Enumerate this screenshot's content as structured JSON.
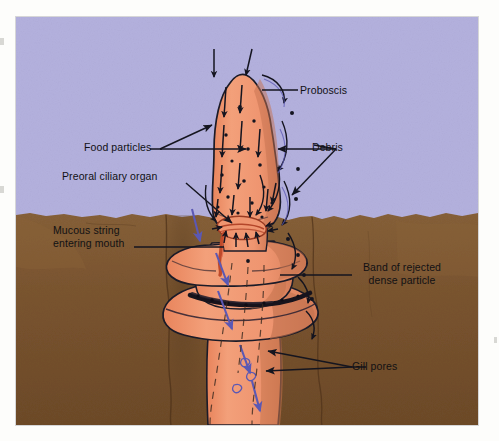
{
  "figure": {
    "media": {
      "water_label": "water column",
      "water_color": "#b4b1de",
      "sediment_label": "sediment",
      "sediment_color": "#7b5530",
      "sediment_dark_color": "#5d3f22",
      "sediment_light_color": "#8d6539",
      "body_color": "#f0976f",
      "body_shadow_color": "#c6714f",
      "outline_color": "#1b1b28",
      "mucous_color": "#c04a2a",
      "arrow_dark_color": "#14141f",
      "arrow_blue_color": "#5b58b4",
      "background_color": "#fdfdfb"
    },
    "labels": [
      {
        "id": "proboscis",
        "name": "Proboscis",
        "text": "Proboscis",
        "x": 300,
        "y": 90,
        "align": "left"
      },
      {
        "id": "food-particles",
        "name": "Food particles",
        "text": "Food particles",
        "x": 84,
        "y": 147,
        "align": "left"
      },
      {
        "id": "debris",
        "name": "Debris",
        "text": "Debris",
        "x": 312,
        "y": 147,
        "align": "left"
      },
      {
        "id": "preoral-ciliary-organ",
        "name": "Preoral ciliary organ",
        "text": "Preoral ciliary organ",
        "x": 62,
        "y": 175,
        "align": "left"
      },
      {
        "id": "mucous-string",
        "name": "Mucous string entering mouth",
        "line1": "Mucous string",
        "line2": "entering mouth",
        "x": 53,
        "y": 228,
        "align": "left"
      },
      {
        "id": "band-of-rejected",
        "name": "Band of rejected dense particle",
        "line1": "Band of rejected",
        "line2": "dense particle",
        "x": 352,
        "y": 265,
        "align": "center"
      },
      {
        "id": "gill-pores",
        "name": "Gill pores",
        "text": "Gill pores",
        "x": 352,
        "y": 365,
        "align": "left"
      }
    ],
    "anatomy": [
      {
        "id": "proboscis",
        "label": "Proboscis"
      },
      {
        "id": "collar",
        "label": "Collar"
      },
      {
        "id": "trunk",
        "label": "Trunk"
      },
      {
        "id": "preoral-ciliary-organ",
        "label": "Preoral ciliary organ"
      },
      {
        "id": "mouth",
        "label": "Mouth"
      },
      {
        "id": "gill-pores",
        "label": "Gill pores"
      }
    ],
    "flows": [
      {
        "id": "food-particle-flow",
        "label": "Food particles",
        "color": "#14141f",
        "note": "dark arrows running down the proboscis toward the mouth"
      },
      {
        "id": "debris-flow",
        "label": "Debris",
        "color": "#14141f",
        "note": "dark arrows sweeping down the outside of the proboscis"
      },
      {
        "id": "water-flow",
        "label": "Water current through gill pores",
        "color": "#5b58b4",
        "note": "blue arrows descending along the trunk"
      },
      {
        "id": "rejected-band",
        "label": "Band of rejected dense particle",
        "color": "#14141f",
        "note": "dark granular band around the collar"
      }
    ]
  }
}
